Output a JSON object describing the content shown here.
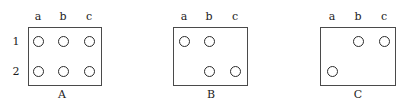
{
  "figure": {
    "width": 412,
    "height": 112,
    "background": "#ffffff",
    "line_color": "#4a4a4a",
    "token_color": "#2b2b2b",
    "text_color": "#1c1c1c"
  },
  "column_headers": [
    "a",
    "b",
    "c"
  ],
  "row_labels": [
    "1",
    "2"
  ],
  "panels": [
    {
      "caption": "A",
      "box": {
        "left": 28,
        "top": 27,
        "width": 74,
        "height": 59
      },
      "show_row_labels": true,
      "columns": [
        "a",
        "b",
        "c"
      ],
      "rows": [
        "1",
        "2"
      ],
      "header_x": [
        38,
        63,
        89
      ],
      "row_label_x": 16,
      "row_y": [
        41,
        71
      ],
      "col_x": [
        38,
        63,
        89
      ],
      "caption_x": 62,
      "tokens": [
        {
          "row": "1",
          "col": "a"
        },
        {
          "row": "1",
          "col": "b"
        },
        {
          "row": "1",
          "col": "c"
        },
        {
          "row": "2",
          "col": "a"
        },
        {
          "row": "2",
          "col": "b"
        },
        {
          "row": "2",
          "col": "c"
        }
      ]
    },
    {
      "caption": "B",
      "box": {
        "left": 173,
        "top": 27,
        "width": 75,
        "height": 59
      },
      "show_row_labels": false,
      "columns": [
        "a",
        "b",
        "c"
      ],
      "rows": [
        "1",
        "2"
      ],
      "header_x": [
        184,
        209,
        235
      ],
      "row_label_x": 161,
      "row_y": [
        41,
        71
      ],
      "col_x": [
        184,
        209,
        235
      ],
      "caption_x": 211,
      "tokens": [
        {
          "row": "1",
          "col": "a"
        },
        {
          "row": "1",
          "col": "b"
        },
        {
          "row": "2",
          "col": "b"
        },
        {
          "row": "2",
          "col": "c"
        }
      ]
    },
    {
      "caption": "C",
      "box": {
        "left": 320,
        "top": 27,
        "width": 76,
        "height": 59
      },
      "show_row_labels": false,
      "columns": [
        "a",
        "b",
        "c"
      ],
      "rows": [
        "1",
        "2"
      ],
      "header_x": [
        332,
        358,
        384
      ],
      "row_label_x": 308,
      "row_y": [
        41,
        71
      ],
      "col_x": [
        332,
        358,
        384
      ],
      "caption_x": 358,
      "tokens": [
        {
          "row": "1",
          "col": "b"
        },
        {
          "row": "1",
          "col": "c"
        },
        {
          "row": "2",
          "col": "a"
        }
      ]
    }
  ]
}
